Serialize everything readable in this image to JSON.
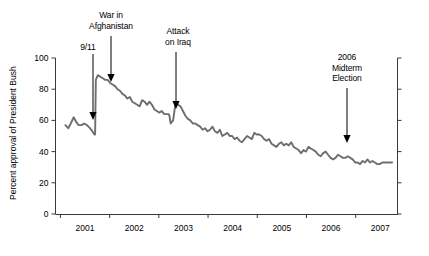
{
  "chart_data": {
    "type": "line",
    "title": "",
    "subtitle": "",
    "xlabel": "",
    "ylabel": "Percent approval of President Bush",
    "ylim": [
      0,
      100
    ],
    "yticks": [
      "0",
      "20",
      "40",
      "60",
      "80",
      "100"
    ],
    "ytick_values": [
      0,
      20,
      40,
      60,
      80,
      100
    ],
    "xlim": [
      2000.9,
      2007.85
    ],
    "xticks": [
      "2001",
      "2002",
      "2003",
      "2004",
      "2005",
      "2006",
      "2007"
    ],
    "xtick_values": [
      2001.5,
      2002.5,
      2003.5,
      2004.5,
      2005.5,
      2006.5,
      2007.5
    ],
    "grid": false,
    "legend": null,
    "series": [
      {
        "name": "Percent approval of President Bush",
        "color": "#6e6e6e",
        "x": [
          2001.1,
          2001.16,
          2001.21,
          2001.27,
          2001.32,
          2001.37,
          2001.43,
          2001.48,
          2001.54,
          2001.6,
          2001.65,
          2001.69,
          2001.705,
          2001.72,
          2001.76,
          2001.81,
          2001.86,
          2001.91,
          2001.96,
          2002.01,
          2002.06,
          2002.11,
          2002.16,
          2002.21,
          2002.26,
          2002.31,
          2002.36,
          2002.41,
          2002.46,
          2002.51,
          2002.56,
          2002.61,
          2002.66,
          2002.71,
          2002.76,
          2002.81,
          2002.86,
          2002.91,
          2002.96,
          2003.01,
          2003.06,
          2003.11,
          2003.16,
          2003.2,
          2003.215,
          2003.24,
          2003.29,
          2003.34,
          2003.39,
          2003.44,
          2003.49,
          2003.54,
          2003.59,
          2003.64,
          2003.69,
          2003.74,
          2003.79,
          2003.84,
          2003.89,
          2003.94,
          2003.99,
          2004.04,
          2004.09,
          2004.14,
          2004.19,
          2004.24,
          2004.29,
          2004.34,
          2004.39,
          2004.44,
          2004.49,
          2004.54,
          2004.59,
          2004.64,
          2004.69,
          2004.74,
          2004.79,
          2004.84,
          2004.89,
          2004.94,
          2004.99,
          2005.04,
          2005.09,
          2005.14,
          2005.19,
          2005.24,
          2005.29,
          2005.34,
          2005.39,
          2005.44,
          2005.49,
          2005.54,
          2005.59,
          2005.64,
          2005.69,
          2005.74,
          2005.79,
          2005.84,
          2005.89,
          2005.94,
          2005.99,
          2006.04,
          2006.09,
          2006.14,
          2006.19,
          2006.24,
          2006.29,
          2006.34,
          2006.39,
          2006.44,
          2006.49,
          2006.54,
          2006.59,
          2006.64,
          2006.69,
          2006.74,
          2006.79,
          2006.84,
          2006.89,
          2006.94,
          2006.99,
          2007.04,
          2007.09,
          2007.14,
          2007.19,
          2007.24,
          2007.29,
          2007.34,
          2007.39,
          2007.44,
          2007.49,
          2007.54,
          2007.59,
          2007.64,
          2007.69,
          2007.74
        ],
        "y": [
          57,
          55,
          58,
          62,
          59,
          57,
          57,
          58,
          57,
          55,
          53,
          51,
          51,
          86,
          89,
          88,
          87,
          86,
          86,
          84,
          83,
          82,
          80,
          79,
          77,
          76,
          74,
          75,
          72,
          71,
          70,
          69,
          73,
          72,
          70,
          72,
          70,
          67,
          66,
          65,
          66,
          64,
          64,
          64,
          63,
          58,
          60,
          71,
          70,
          69,
          66,
          63,
          61,
          60,
          58,
          58,
          57,
          56,
          54,
          55,
          53,
          54,
          56,
          53,
          52,
          54,
          50,
          51,
          52,
          50,
          50,
          48,
          49,
          47,
          46,
          48,
          50,
          49,
          48,
          52,
          51,
          51,
          50,
          48,
          47,
          48,
          45,
          44,
          43,
          45,
          46,
          44,
          45,
          44,
          46,
          43,
          42,
          41,
          39,
          41,
          40,
          43,
          42,
          41,
          40,
          38,
          37,
          39,
          40,
          38,
          36,
          35,
          36,
          38,
          37,
          36,
          36,
          37,
          36,
          35,
          33,
          33,
          32,
          34,
          33,
          35,
          33,
          34,
          33,
          32,
          32,
          33,
          33,
          33,
          33,
          33
        ]
      }
    ],
    "annotations": [
      {
        "id": "nine-eleven",
        "label": "9/11",
        "lines": [
          "9/11"
        ],
        "text_x": 88,
        "text_y": 42,
        "arrow_x": 93,
        "arrow_y1": 54,
        "arrow_y2": 120
      },
      {
        "id": "war-in-afghanistan",
        "label": "War in Afghanistan",
        "lines": [
          "War in",
          "Afghanistan"
        ],
        "text_x": 111,
        "text_y": 10,
        "arrow_x": 111,
        "arrow_y1": 36,
        "arrow_y2": 82
      },
      {
        "id": "attack-on-iraq",
        "label": "Attack on Iraq",
        "lines": [
          "Attack",
          "on Iraq"
        ],
        "text_x": 178,
        "text_y": 26,
        "arrow_x": 176,
        "arrow_y1": 52,
        "arrow_y2": 109
      },
      {
        "id": "midterm-election-2006",
        "label": "2006 Midterm Election",
        "lines": [
          "2006",
          "Midterm",
          "Election"
        ],
        "text_x": 347,
        "text_y": 52,
        "arrow_x": 347,
        "arrow_y1": 88,
        "arrow_y2": 143
      }
    ]
  },
  "axis": {
    "y_label": "Percent approval of President Bush",
    "y_ticks": [
      "100",
      "80",
      "60",
      "40",
      "20",
      "0"
    ],
    "x_ticks": [
      "2001",
      "2002",
      "2003",
      "2004",
      "2005",
      "2006",
      "2007"
    ]
  },
  "colors": {
    "line": "#6e6e6e",
    "axis": "#3a3a3a",
    "text": "#000000",
    "background": "#ffffff"
  }
}
